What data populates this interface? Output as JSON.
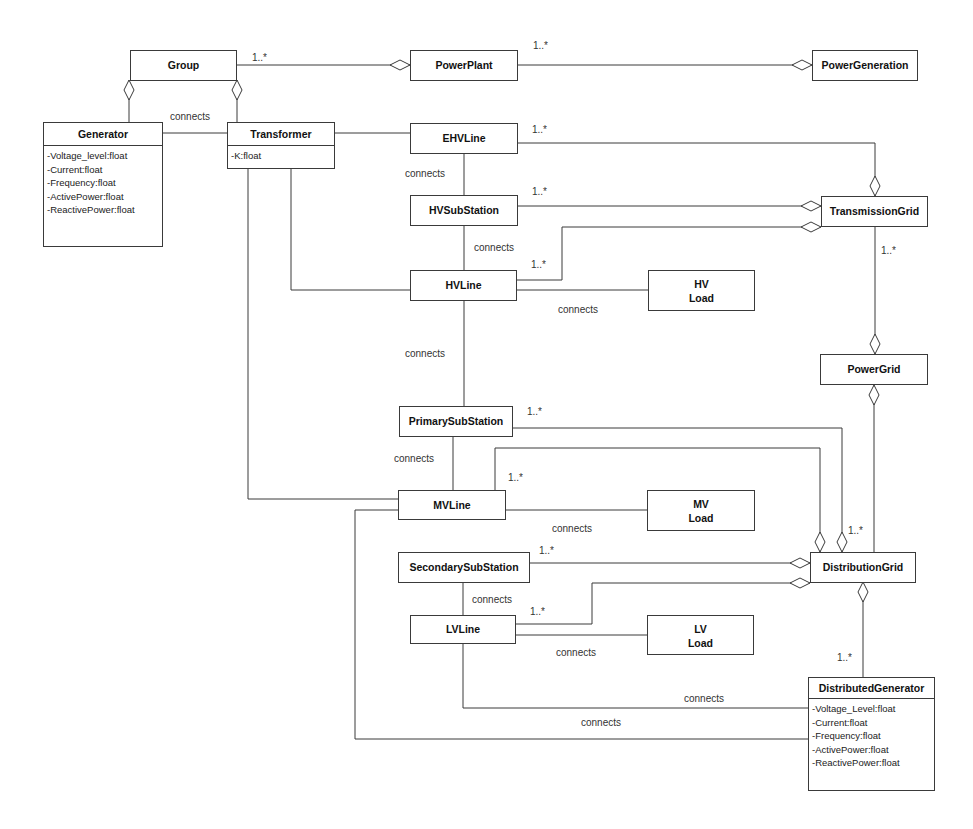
{
  "diagram": {
    "type": "UML class diagram",
    "classes": {
      "group": {
        "name": "Group"
      },
      "powerplant": {
        "name": "PowerPlant"
      },
      "powergeneration": {
        "name": "PowerGeneration"
      },
      "generator": {
        "name": "Generator",
        "attributes": [
          "-Voltage_level:float",
          "-Current:float",
          "-Frequency:float",
          "-ActivePower:float",
          "-ReactivePower:float"
        ]
      },
      "transformer": {
        "name": "Transformer",
        "attributes": [
          "-K:float"
        ]
      },
      "ehvline": {
        "name": "EHVLine"
      },
      "hvsubstation": {
        "name": "HVSubStation"
      },
      "transmissiongrid": {
        "name": "TransmissionGrid"
      },
      "hvline": {
        "name": "HVLine"
      },
      "hvload": {
        "line1": "HV",
        "line2": "Load"
      },
      "powergrid": {
        "name": "PowerGrid"
      },
      "primarysubstation": {
        "name": "PrimarySubStation"
      },
      "mvline": {
        "name": "MVLine"
      },
      "mvload": {
        "line1": "MV",
        "line2": "Load"
      },
      "secondarysubstation": {
        "name": "SecondarySubStation"
      },
      "distributiongrid": {
        "name": "DistributionGrid"
      },
      "lvline": {
        "name": "LVLine"
      },
      "lvload": {
        "line1": "LV",
        "line2": "Load"
      },
      "distributedgenerator": {
        "name": "DistributedGenerator",
        "attributes": [
          "-Voltage_Level:float",
          "-Current:float",
          "-Frequency:float",
          "-ActivePower:float",
          "-ReactivePower:float"
        ]
      }
    },
    "labels": {
      "connects": "connects",
      "multiplicity": "1..*"
    }
  }
}
